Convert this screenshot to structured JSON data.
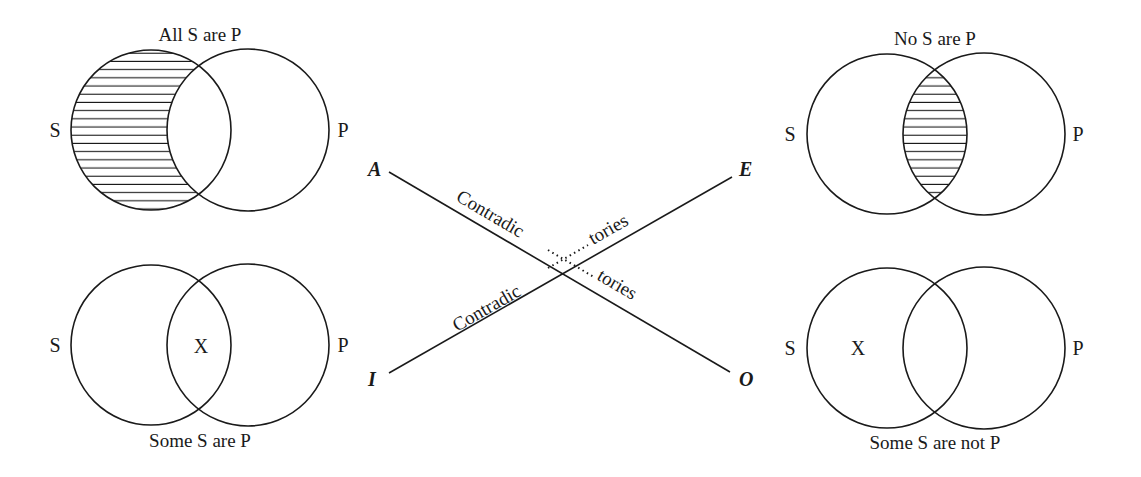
{
  "diagram": {
    "type": "square-of-opposition-venn",
    "corners": {
      "A": "A",
      "E": "E",
      "I": "I",
      "O": "O"
    },
    "relation": {
      "label_left": "Contradic",
      "label_right": "tories"
    },
    "venn": {
      "A": {
        "title": "All S are P",
        "set_s": "S",
        "set_p": "P",
        "shaded": "S-only",
        "marker": ""
      },
      "E": {
        "title": "No S are P",
        "set_s": "S",
        "set_p": "P",
        "shaded": "intersection",
        "marker": ""
      },
      "I": {
        "title": "Some S are P",
        "set_s": "S",
        "set_p": "P",
        "shaded": "none",
        "marker": "X"
      },
      "O": {
        "title": "Some S are not P",
        "set_s": "S",
        "set_p": "P",
        "shaded": "none",
        "marker": "X"
      }
    },
    "colors": {
      "ink": "#1a1a1a",
      "background": "#ffffff"
    }
  }
}
